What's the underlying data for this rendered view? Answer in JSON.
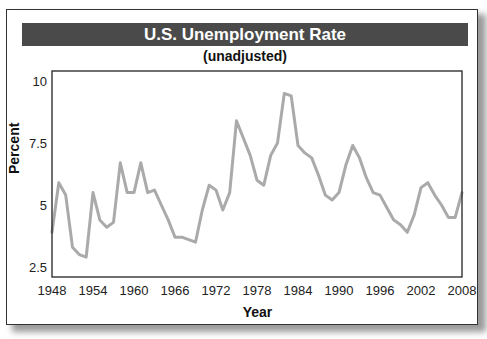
{
  "chart": {
    "title": "U.S. Unemployment Rate",
    "subtitle": "(unadjusted)",
    "xlabel": "Year",
    "ylabel": "Percent"
  },
  "chart_data": {
    "type": "line",
    "title": "U.S. Unemployment Rate",
    "subtitle": "(unadjusted)",
    "xlabel": "Year",
    "ylabel": "Percent",
    "xlim": [
      1948,
      2008
    ],
    "ylim": [
      2.5,
      10
    ],
    "x_ticks": [
      1948,
      1954,
      1960,
      1966,
      1972,
      1978,
      1984,
      1990,
      1996,
      2002,
      2008
    ],
    "y_ticks": [
      2.5,
      5,
      7.5,
      10
    ],
    "y_tick_labels": [
      "2.5",
      "5",
      "7.5",
      "10"
    ],
    "grid": false,
    "legend": null,
    "line_color": "#aaaaaa",
    "series": [
      {
        "name": "Unemployment rate",
        "x": [
          1948,
          1949,
          1950,
          1951,
          1952,
          1953,
          1954,
          1955,
          1956,
          1957,
          1958,
          1959,
          1960,
          1961,
          1962,
          1963,
          1964,
          1965,
          1966,
          1967,
          1968,
          1969,
          1970,
          1971,
          1972,
          1973,
          1974,
          1975,
          1976,
          1977,
          1978,
          1979,
          1980,
          1981,
          1982,
          1983,
          1984,
          1985,
          1986,
          1987,
          1988,
          1989,
          1990,
          1991,
          1992,
          1993,
          1994,
          1995,
          1996,
          1997,
          1998,
          1999,
          2000,
          2001,
          2002,
          2003,
          2004,
          2005,
          2006,
          2007,
          2008
        ],
        "values": [
          3.9,
          5.9,
          5.4,
          3.3,
          3.0,
          2.9,
          5.5,
          4.4,
          4.1,
          4.3,
          6.7,
          5.5,
          5.5,
          6.7,
          5.5,
          5.6,
          5.0,
          4.4,
          3.7,
          3.7,
          3.6,
          3.5,
          4.8,
          5.8,
          5.6,
          4.8,
          5.5,
          8.4,
          7.7,
          7.0,
          6.0,
          5.8,
          7.0,
          7.5,
          9.5,
          9.4,
          7.4,
          7.1,
          6.9,
          6.2,
          5.4,
          5.2,
          5.5,
          6.6,
          7.4,
          6.9,
          6.1,
          5.5,
          5.4,
          4.9,
          4.4,
          4.2,
          3.9,
          4.6,
          5.7,
          5.9,
          5.4,
          5.0,
          4.5,
          4.5,
          5.5
        ]
      }
    ]
  }
}
